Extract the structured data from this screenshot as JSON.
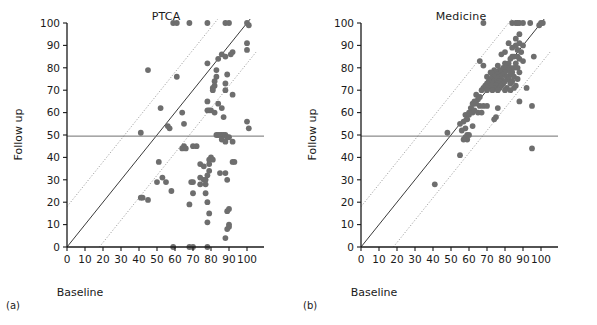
{
  "figure": {
    "subfigure_a_label": "(a)",
    "subfigure_b_label": "(b)",
    "point_color": "#6e6e6e",
    "line_color": "#3a3a3a",
    "axis_color": "#1a1a1a"
  },
  "panel_a": {
    "title": "PTCA",
    "xlabel": "Baseline",
    "ylabel": "Follow up"
  },
  "panel_b": {
    "title": "Medicine",
    "xlabel": "Baseline",
    "ylabel": "Follow up"
  },
  "chart_data": [
    {
      "type": "scatter",
      "title": "PTCA",
      "xlabel": "Baseline",
      "ylabel": "Follow up",
      "xlim": [
        0,
        105
      ],
      "ylim": [
        0,
        102
      ],
      "xticks": [
        0,
        10,
        20,
        30,
        40,
        50,
        60,
        70,
        80,
        90,
        100
      ],
      "yticks": [
        0,
        10,
        20,
        30,
        40,
        50,
        60,
        70,
        80,
        90,
        100
      ],
      "grid": false,
      "legend": "none",
      "reference_lines": [
        {
          "name": "identity-line",
          "style": "solid",
          "slope": 1,
          "intercept": 0
        },
        {
          "name": "upper-limit-line",
          "style": "dotted",
          "slope": 1,
          "intercept": 18
        },
        {
          "name": "lower-limit-line",
          "style": "dotted",
          "slope": 1,
          "intercept": -18
        },
        {
          "name": "threshold-line-50",
          "style": "solid",
          "slope": 0,
          "intercept": 49.5
        }
      ],
      "points": [
        [
          59,
          100
        ],
        [
          61,
          100
        ],
        [
          68,
          100
        ],
        [
          78,
          100
        ],
        [
          88,
          100
        ],
        [
          90,
          100
        ],
        [
          100,
          100
        ],
        [
          101,
          99
        ],
        [
          100,
          91
        ],
        [
          100,
          88
        ],
        [
          92,
          87
        ],
        [
          91,
          86
        ],
        [
          86,
          86
        ],
        [
          88,
          85
        ],
        [
          84,
          84
        ],
        [
          78,
          82
        ],
        [
          45,
          79
        ],
        [
          83,
          79
        ],
        [
          89,
          77
        ],
        [
          83,
          76
        ],
        [
          61,
          76
        ],
        [
          82,
          74
        ],
        [
          88,
          73
        ],
        [
          82,
          72
        ],
        [
          81,
          71
        ],
        [
          88,
          70
        ],
        [
          81,
          70
        ],
        [
          92,
          68
        ],
        [
          78,
          65
        ],
        [
          84,
          64
        ],
        [
          52,
          62
        ],
        [
          86,
          62
        ],
        [
          80,
          61
        ],
        [
          79,
          61
        ],
        [
          78,
          61
        ],
        [
          82,
          60
        ],
        [
          64,
          60
        ],
        [
          87,
          58
        ],
        [
          100,
          56
        ],
        [
          65,
          55
        ],
        [
          56,
          54
        ],
        [
          101,
          53
        ],
        [
          57,
          53
        ],
        [
          41,
          51
        ],
        [
          83,
          50
        ],
        [
          84,
          50
        ],
        [
          85,
          50
        ],
        [
          86,
          50
        ],
        [
          87,
          50
        ],
        [
          88,
          50
        ],
        [
          89,
          49
        ],
        [
          90,
          49
        ],
        [
          86,
          48
        ],
        [
          88,
          47
        ],
        [
          92,
          47
        ],
        [
          65,
          45
        ],
        [
          72,
          45
        ],
        [
          70,
          45
        ],
        [
          64,
          44
        ],
        [
          66,
          44
        ],
        [
          80,
          40
        ],
        [
          79,
          39
        ],
        [
          81,
          39
        ],
        [
          92,
          38
        ],
        [
          93,
          38
        ],
        [
          51,
          38
        ],
        [
          79,
          37
        ],
        [
          74,
          37
        ],
        [
          76,
          36
        ],
        [
          79,
          34
        ],
        [
          85,
          33
        ],
        [
          88,
          33
        ],
        [
          78,
          32
        ],
        [
          74,
          31
        ],
        [
          53,
          31
        ],
        [
          50,
          29
        ],
        [
          76,
          30
        ],
        [
          77,
          30
        ],
        [
          89,
          30
        ],
        [
          70,
          29
        ],
        [
          69,
          29
        ],
        [
          55,
          29
        ],
        [
          74,
          28
        ],
        [
          77,
          28
        ],
        [
          58,
          25
        ],
        [
          70,
          24
        ],
        [
          77,
          24
        ],
        [
          42,
          22
        ],
        [
          41,
          22
        ],
        [
          45,
          21
        ],
        [
          78,
          20
        ],
        [
          68,
          19
        ],
        [
          90,
          17
        ],
        [
          89,
          16
        ],
        [
          79,
          15
        ],
        [
          78,
          11
        ],
        [
          90,
          10
        ],
        [
          90,
          9
        ],
        [
          89,
          8
        ],
        [
          88,
          4
        ],
        [
          59,
          0
        ],
        [
          68,
          0
        ],
        [
          70,
          0
        ],
        [
          78,
          0
        ]
      ]
    },
    {
      "type": "scatter",
      "title": "Medicine",
      "xlabel": "Baseline",
      "ylabel": "Follow up",
      "xlim": [
        0,
        105
      ],
      "ylim": [
        0,
        102
      ],
      "xticks": [
        0,
        10,
        20,
        30,
        40,
        50,
        60,
        70,
        80,
        90,
        100
      ],
      "yticks": [
        0,
        10,
        20,
        30,
        40,
        50,
        60,
        70,
        80,
        90,
        100
      ],
      "grid": false,
      "legend": "none",
      "reference_lines": [
        {
          "name": "identity-line",
          "style": "solid",
          "slope": 1,
          "intercept": 0
        },
        {
          "name": "upper-limit-line",
          "style": "dotted",
          "slope": 1,
          "intercept": 18
        },
        {
          "name": "lower-limit-line",
          "style": "dotted",
          "slope": 1,
          "intercept": -18
        },
        {
          "name": "threshold-line-50",
          "style": "solid",
          "slope": 0,
          "intercept": 49.5
        }
      ],
      "points": [
        [
          68,
          100
        ],
        [
          84,
          100
        ],
        [
          86,
          100
        ],
        [
          87,
          100
        ],
        [
          88,
          100
        ],
        [
          90,
          100
        ],
        [
          94,
          100
        ],
        [
          100,
          100
        ],
        [
          101,
          100
        ],
        [
          99,
          99
        ],
        [
          88,
          95
        ],
        [
          86,
          93
        ],
        [
          82,
          91
        ],
        [
          88,
          91
        ],
        [
          90,
          90
        ],
        [
          86,
          90
        ],
        [
          84,
          89
        ],
        [
          87,
          88
        ],
        [
          80,
          87
        ],
        [
          89,
          87
        ],
        [
          78,
          86
        ],
        [
          96,
          85
        ],
        [
          84,
          85
        ],
        [
          85,
          85
        ],
        [
          87,
          85
        ],
        [
          83,
          84
        ],
        [
          66,
          83
        ],
        [
          88,
          84
        ],
        [
          90,
          83
        ],
        [
          80,
          82
        ],
        [
          82,
          82
        ],
        [
          86,
          82
        ],
        [
          68,
          81
        ],
        [
          76,
          81
        ],
        [
          79,
          80
        ],
        [
          81,
          80
        ],
        [
          83,
          80
        ],
        [
          85,
          80
        ],
        [
          87,
          80
        ],
        [
          74,
          79
        ],
        [
          77,
          79
        ],
        [
          82,
          79
        ],
        [
          72,
          78
        ],
        [
          75,
          78
        ],
        [
          78,
          78
        ],
        [
          80,
          78
        ],
        [
          84,
          78
        ],
        [
          88,
          78
        ],
        [
          73,
          77
        ],
        [
          76,
          77
        ],
        [
          79,
          77
        ],
        [
          83,
          77
        ],
        [
          70,
          76
        ],
        [
          74,
          76
        ],
        [
          77,
          76
        ],
        [
          81,
          76
        ],
        [
          85,
          76
        ],
        [
          72,
          75
        ],
        [
          75,
          75
        ],
        [
          78,
          75
        ],
        [
          82,
          75
        ],
        [
          87,
          75
        ],
        [
          71,
          74
        ],
        [
          74,
          74
        ],
        [
          77,
          74
        ],
        [
          80,
          74
        ],
        [
          84,
          74
        ],
        [
          92,
          71
        ],
        [
          70,
          73
        ],
        [
          73,
          73
        ],
        [
          76,
          73
        ],
        [
          79,
          73
        ],
        [
          83,
          73
        ],
        [
          86,
          72
        ],
        [
          69,
          72
        ],
        [
          72,
          72
        ],
        [
          75,
          72
        ],
        [
          78,
          72
        ],
        [
          81,
          71
        ],
        [
          85,
          71
        ],
        [
          68,
          71
        ],
        [
          71,
          71
        ],
        [
          74,
          71
        ],
        [
          77,
          71
        ],
        [
          80,
          70
        ],
        [
          83,
          70
        ],
        [
          67,
          70
        ],
        [
          70,
          70
        ],
        [
          73,
          70
        ],
        [
          76,
          70
        ],
        [
          64,
          68
        ],
        [
          66,
          67
        ],
        [
          65,
          66
        ],
        [
          63,
          65
        ],
        [
          88,
          65
        ],
        [
          62,
          64
        ],
        [
          64,
          64
        ],
        [
          95,
          63
        ],
        [
          66,
          63
        ],
        [
          68,
          63
        ],
        [
          70,
          63
        ],
        [
          76,
          62
        ],
        [
          61,
          62
        ],
        [
          63,
          61
        ],
        [
          60,
          60
        ],
        [
          62,
          60
        ],
        [
          65,
          60
        ],
        [
          67,
          60
        ],
        [
          58,
          59
        ],
        [
          60,
          59
        ],
        [
          75,
          58
        ],
        [
          74,
          57
        ],
        [
          59,
          57
        ],
        [
          57,
          56
        ],
        [
          55,
          55
        ],
        [
          62,
          54
        ],
        [
          58,
          53
        ],
        [
          56,
          52
        ],
        [
          48,
          51
        ],
        [
          59,
          50
        ],
        [
          60,
          50
        ],
        [
          58,
          49
        ],
        [
          59,
          48
        ],
        [
          57,
          48
        ],
        [
          95,
          44
        ],
        [
          55,
          41
        ],
        [
          41,
          28
        ]
      ]
    }
  ]
}
